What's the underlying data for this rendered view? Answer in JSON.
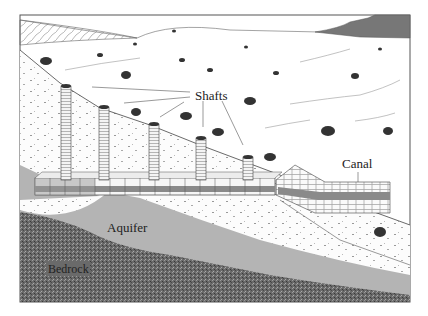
{
  "diagram": {
    "type": "cross-section illustration",
    "labels": {
      "shafts": "Shafts",
      "canal": "Canal",
      "aquifer": "Aquifer",
      "bedrock": "Bedrock"
    },
    "elements": [
      {
        "name": "shaft",
        "count": 5
      },
      {
        "name": "tunnel",
        "description": "horizontal underground channel connecting shaft bases"
      },
      {
        "name": "canal",
        "description": "brick-lined surface canal at outlet"
      },
      {
        "name": "aquifer",
        "description": "grey water-bearing layer"
      },
      {
        "name": "bedrock",
        "description": "dark speckled layer at bottom"
      },
      {
        "name": "mountains",
        "description": "dark ridge at top right background"
      },
      {
        "name": "shrubs",
        "description": "scattered desert vegetation"
      }
    ],
    "colors": {
      "bedrock": "#6e6e6e",
      "aquifer": "#b4b4b4",
      "mountain": "#7a7a7a",
      "line": "#444444",
      "soil": "#fbfbfb"
    }
  }
}
